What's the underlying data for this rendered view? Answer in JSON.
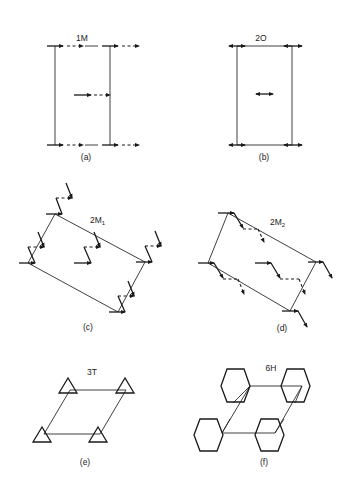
{
  "figure": {
    "panels": [
      {
        "id": "a",
        "title": "1M",
        "caption": "(a)",
        "description": "Rectangular cell with solid and dashed horizontal arrows (one-dimensional monoclinic-type)"
      },
      {
        "id": "b",
        "title": "2O",
        "caption": "(b)",
        "description": "Rectangular cell with double-headed horizontal arrows"
      },
      {
        "id": "c",
        "title": "2M",
        "title_sub": "1",
        "caption": "(c)",
        "description": "Oblique parallelogram cell with zigzag solid/dashed arrows"
      },
      {
        "id": "d",
        "title": "2M",
        "title_sub": "2",
        "caption": "(d)",
        "description": "Oblique parallelogram cell with stepped solid/dashed arrows"
      },
      {
        "id": "e",
        "title": "3T",
        "caption": "(e)",
        "description": "Rhombic cell with triangular arrow loops at lattice points"
      },
      {
        "id": "f",
        "title": "6H",
        "caption": "(f)",
        "description": "Rhombic cell with hexagonal arrow loops at lattice points"
      }
    ]
  }
}
